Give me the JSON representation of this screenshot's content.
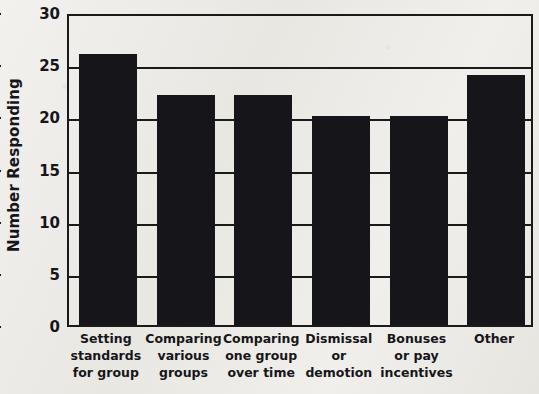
{
  "chart_data": {
    "type": "bar",
    "title": "",
    "xlabel": "",
    "ylabel": "Number Responding",
    "ylim": [
      0,
      30
    ],
    "yticks": [
      0,
      5,
      10,
      15,
      20,
      25,
      30
    ],
    "ytick_labels": [
      "0",
      "5",
      "10",
      "15",
      "20",
      "25",
      "30"
    ],
    "grid": true,
    "legend": null,
    "categories": [
      "Setting standards for group",
      "Comparing various groups",
      "Comparing one group over time",
      "Dismissal or demotion",
      "Bonuses or pay incentives",
      "Other"
    ],
    "category_label_lines": [
      [
        "Setting",
        "standards",
        "for group"
      ],
      [
        "Comparing",
        "various",
        "groups"
      ],
      [
        "Comparing",
        "one group",
        "over time"
      ],
      [
        "Dismissal",
        "or",
        "demotion"
      ],
      [
        "Bonuses",
        "or pay",
        "incentives"
      ],
      [
        "Other"
      ]
    ],
    "values": [
      26,
      22,
      22,
      20,
      20,
      24
    ],
    "bar_color": "#16161a",
    "axis_color": "#1a1a1a",
    "background_color": "#eceae6"
  }
}
